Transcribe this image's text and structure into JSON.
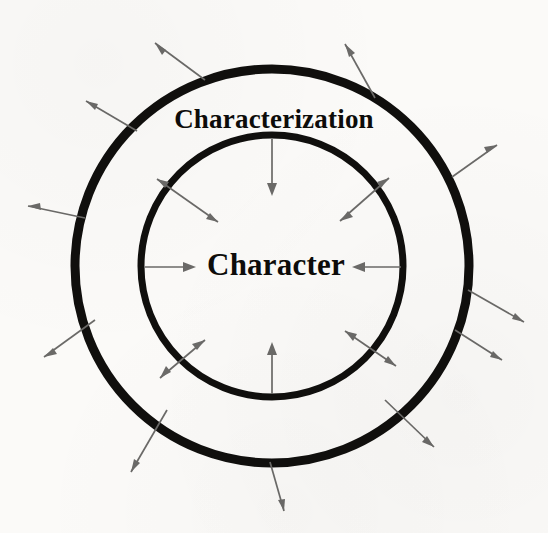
{
  "canvas": {
    "width": 548,
    "height": 533,
    "background": "#fbfaf8"
  },
  "labels": {
    "outer_ring": "Characterization",
    "inner_circle": "Character"
  },
  "colors": {
    "ring_stroke": "#100f0d",
    "arrow_stroke": "#6b6a68",
    "text": "#0d0c0a",
    "background": "#fbfaf8"
  },
  "diagram": {
    "type": "concentric-circle-arrow-diagram",
    "center": {
      "x": 272,
      "y": 266
    },
    "rings": [
      {
        "name": "outer-ring",
        "label": "Characterization",
        "radius": 197,
        "stroke_width": 9
      },
      {
        "name": "inner-ring",
        "label": "Character",
        "radius": 131,
        "stroke_width": 7
      }
    ],
    "outer_arrows": {
      "count": 10,
      "direction": "outward",
      "heads": "single",
      "length": 52,
      "angles_deg": [
        250,
        288,
        315,
        341,
        6,
        33,
        62,
        90,
        118,
        205
      ]
    },
    "inner_arrows": {
      "double_headed": {
        "count": 4,
        "angles_deg": [
          135,
          45,
          315,
          225
        ],
        "inner_radius": 100,
        "outer_radius": 163
      },
      "inward_single": {
        "count": 4,
        "description": "arrows from the inner circle pointing toward the center label",
        "angles_deg": [
          90,
          180,
          0,
          270
        ]
      }
    }
  }
}
